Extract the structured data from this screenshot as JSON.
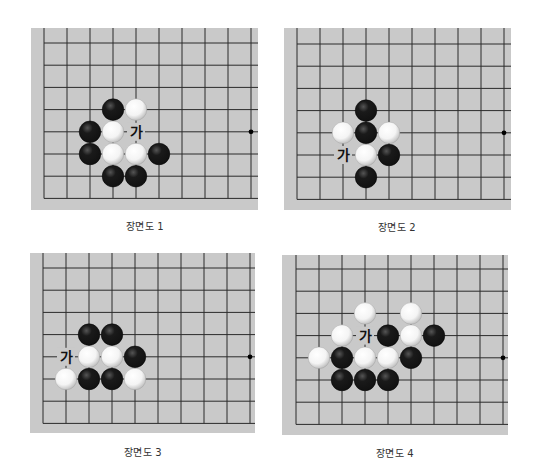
{
  "colors": {
    "board": "#c9c9c9",
    "grid_line": "#2b2b2b",
    "black_stone": "#111111",
    "white_stone": "#f4f4f4",
    "caption_text": "#333333"
  },
  "grid": {
    "cols": 10,
    "rows": 8,
    "spacing_x": 23,
    "spacing_y": 22.2
  },
  "diagrams": [
    {
      "caption": "장면도 1",
      "board": {
        "left": 31,
        "top": 28,
        "width": 227,
        "height": 182,
        "origin_x": 13,
        "origin_y": 15
      },
      "caption_pos": {
        "x": 85,
        "y": 218
      },
      "star_points": [
        [
          9,
          4
        ]
      ],
      "stones": [
        {
          "col": 3,
          "row": 3,
          "color": "black"
        },
        {
          "col": 4,
          "row": 3,
          "color": "white"
        },
        {
          "col": 2,
          "row": 4,
          "color": "black"
        },
        {
          "col": 3,
          "row": 4,
          "color": "white"
        },
        {
          "col": 2,
          "row": 5,
          "color": "black"
        },
        {
          "col": 3,
          "row": 5,
          "color": "white"
        },
        {
          "col": 4,
          "row": 5,
          "color": "white"
        },
        {
          "col": 5,
          "row": 5,
          "color": "black"
        },
        {
          "col": 3,
          "row": 6,
          "color": "black"
        },
        {
          "col": 4,
          "row": 6,
          "color": "black"
        }
      ],
      "labels": [
        {
          "col": 4,
          "row": 4,
          "text": "가"
        }
      ]
    },
    {
      "caption": "장면도 2",
      "board": {
        "left": 284,
        "top": 28,
        "width": 227,
        "height": 182,
        "origin_x": 13,
        "origin_y": 16
      },
      "caption_pos": {
        "x": 337,
        "y": 219
      },
      "star_points": [
        [
          9,
          4
        ]
      ],
      "stones": [
        {
          "col": 3,
          "row": 3,
          "color": "black"
        },
        {
          "col": 2,
          "row": 4,
          "color": "white"
        },
        {
          "col": 3,
          "row": 4,
          "color": "black"
        },
        {
          "col": 4,
          "row": 4,
          "color": "white"
        },
        {
          "col": 3,
          "row": 5,
          "color": "white"
        },
        {
          "col": 4,
          "row": 5,
          "color": "black"
        },
        {
          "col": 3,
          "row": 6,
          "color": "black"
        }
      ],
      "labels": [
        {
          "col": 2,
          "row": 5,
          "text": "가"
        }
      ]
    },
    {
      "caption": "장면도 3",
      "board": {
        "left": 30,
        "top": 253,
        "width": 225,
        "height": 180,
        "origin_x": 13,
        "origin_y": 15
      },
      "caption_pos": {
        "x": 83,
        "y": 444
      },
      "star_points": [
        [
          9,
          4
        ]
      ],
      "stones": [
        {
          "col": 2,
          "row": 3,
          "color": "black"
        },
        {
          "col": 3,
          "row": 3,
          "color": "black"
        },
        {
          "col": 2,
          "row": 4,
          "color": "white"
        },
        {
          "col": 3,
          "row": 4,
          "color": "white"
        },
        {
          "col": 4,
          "row": 4,
          "color": "black"
        },
        {
          "col": 1,
          "row": 5,
          "color": "white"
        },
        {
          "col": 2,
          "row": 5,
          "color": "black"
        },
        {
          "col": 3,
          "row": 5,
          "color": "black"
        },
        {
          "col": 4,
          "row": 5,
          "color": "white"
        }
      ],
      "labels": [
        {
          "col": 1,
          "row": 4,
          "text": "가"
        }
      ]
    },
    {
      "caption": "장면도 4",
      "board": {
        "left": 282,
        "top": 255,
        "width": 226,
        "height": 180,
        "origin_x": 14,
        "origin_y": 14
      },
      "caption_pos": {
        "x": 335,
        "y": 445
      },
      "star_points": [
        [
          9,
          4
        ]
      ],
      "stones": [
        {
          "col": 3,
          "row": 2,
          "color": "white"
        },
        {
          "col": 5,
          "row": 2,
          "color": "white"
        },
        {
          "col": 2,
          "row": 3,
          "color": "white"
        },
        {
          "col": 4,
          "row": 3,
          "color": "black"
        },
        {
          "col": 5,
          "row": 3,
          "color": "white"
        },
        {
          "col": 6,
          "row": 3,
          "color": "black"
        },
        {
          "col": 1,
          "row": 4,
          "color": "white"
        },
        {
          "col": 2,
          "row": 4,
          "color": "black"
        },
        {
          "col": 3,
          "row": 4,
          "color": "white"
        },
        {
          "col": 4,
          "row": 4,
          "color": "white"
        },
        {
          "col": 5,
          "row": 4,
          "color": "black"
        },
        {
          "col": 2,
          "row": 5,
          "color": "black"
        },
        {
          "col": 3,
          "row": 5,
          "color": "black"
        },
        {
          "col": 4,
          "row": 5,
          "color": "black"
        }
      ],
      "labels": [
        {
          "col": 3,
          "row": 3,
          "text": "가"
        }
      ]
    }
  ]
}
